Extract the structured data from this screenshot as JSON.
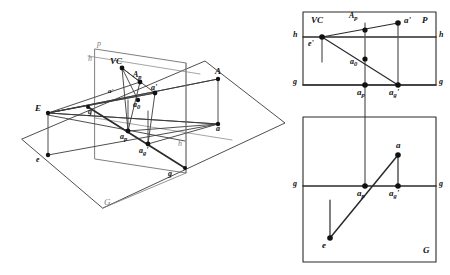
{
  "figure": {
    "type": "descriptive-geometry-diagram",
    "stroke_color": "#333333",
    "faint_stroke_color": "#8a8a8a",
    "node_color": "#111111",
    "background": "#ffffff"
  },
  "pictorial": {
    "name": "3D pictorial view",
    "plane_ground_label": "G",
    "plane_picture_label": "p",
    "labels": {
      "E": "E",
      "e": "e",
      "A": "A",
      "a": "a",
      "VC": "VC",
      "Ap": "A",
      "Ap_sub": "p",
      "a_prime": "a'",
      "a0": "a",
      "a0_sub": "0",
      "ap": "a",
      "ap_sub": "p",
      "ag_prime": "a",
      "ag_prime_sub": "g",
      "ag_prime_tick": "'",
      "g_left": "g",
      "g_right": "g",
      "h_upper": "h",
      "h_lower": "h",
      "a_quote": "a'"
    }
  },
  "panel_p": {
    "name": "picture plane projection panel",
    "corner_label": "P",
    "line_h_left": "h",
    "line_h_right": "h",
    "line_g_left": "g",
    "line_g_right": "g",
    "labels": {
      "VC": "VC",
      "e_prime": "e'",
      "Ap": "A",
      "Ap_sub": "p",
      "a_prime": "a'",
      "a0": "a",
      "a0_sub": "0",
      "ap": "a",
      "ap_sub": "p",
      "ag_prime": "a",
      "ag_prime_sub": "g",
      "ag_prime_tick": "'"
    }
  },
  "panel_g": {
    "name": "ground plane projection panel",
    "corner_label": "G",
    "line_g_left": "g",
    "line_g_right": "g",
    "labels": {
      "a": "a",
      "ap": "a",
      "ap_sub": "p",
      "ag_prime": "a",
      "ag_prime_sub": "g",
      "ag_prime_tick": "'",
      "e": "e"
    }
  }
}
